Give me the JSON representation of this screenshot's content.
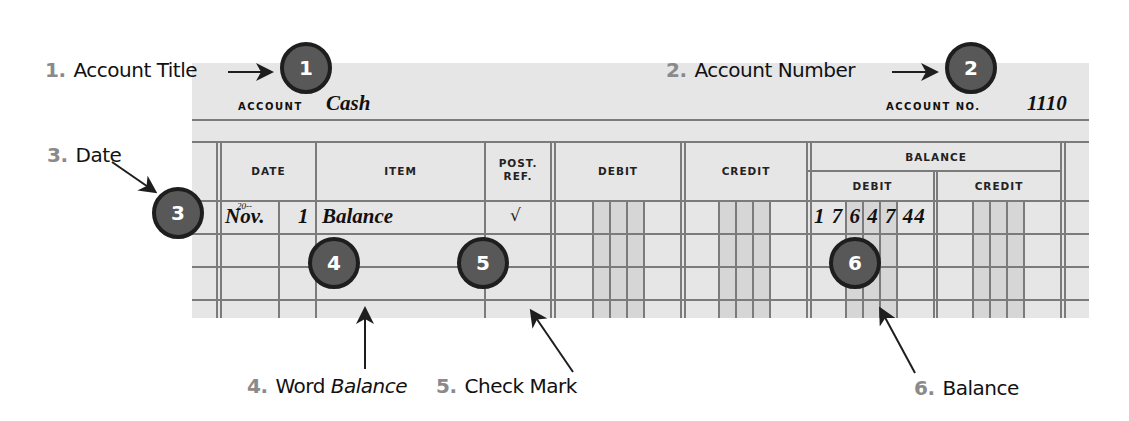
{
  "account": {
    "title_label": "ACCOUNT",
    "title_value": "Cash",
    "number_label": "ACCOUNT NO.",
    "number_value": "1110"
  },
  "columns": {
    "date": "DATE",
    "item": "ITEM",
    "post_ref_line1": "POST.",
    "post_ref_line2": "REF.",
    "debit": "DEBIT",
    "credit": "CREDIT",
    "balance": "BALANCE",
    "balance_debit": "DEBIT",
    "balance_credit": "CREDIT"
  },
  "rows": [
    {
      "year": "20--",
      "month": "Nov.",
      "day": "1",
      "item": "Balance",
      "post_ref": "√",
      "debit": "",
      "credit": "",
      "balance_debit_dollars": "17647",
      "balance_debit_cents": "44",
      "balance_debit_display": "1 7 6 4 7 44",
      "balance_credit": ""
    }
  ],
  "markers": [
    "1",
    "2",
    "3",
    "4",
    "5",
    "6"
  ],
  "callouts": [
    {
      "num": "1.",
      "text": "Account Title"
    },
    {
      "num": "2.",
      "text": "Account Number"
    },
    {
      "num": "3.",
      "text": "Date"
    },
    {
      "num": "4.",
      "text": "Word ",
      "italic": "Balance"
    },
    {
      "num": "5.",
      "text": "Check Mark"
    },
    {
      "num": "6.",
      "text": "Balance"
    }
  ],
  "colors": {
    "ledger_bg": "#e6e6e6",
    "grid_line": "#7b7b7b",
    "money_shade": "#d6d6d6",
    "marker_fill": "#585858",
    "marker_border": "#1e1e1e",
    "callout_number": "#8a8a8a"
  }
}
